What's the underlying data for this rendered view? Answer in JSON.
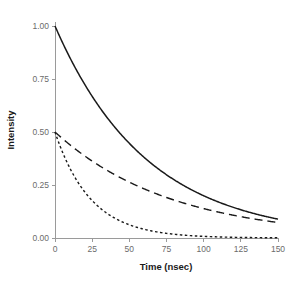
{
  "chart_data": {
    "type": "line",
    "title": "",
    "xlabel": "Time (nsec)",
    "ylabel": "Intensity",
    "xlim": [
      0,
      150
    ],
    "ylim": [
      0,
      1.0
    ],
    "xticks": [
      0,
      25,
      50,
      75,
      100,
      125,
      150
    ],
    "xtick_labels": [
      "0",
      "25",
      "50",
      "75",
      "100",
      "125",
      "150"
    ],
    "yticks": [
      0.0,
      0.25,
      0.5,
      0.75,
      1.0
    ],
    "ytick_labels": [
      "0.00",
      "0.25",
      "0.50",
      "0.75",
      "1.00"
    ],
    "grid": false,
    "legend": "none",
    "line_color": "#1a1a1a",
    "axis_color": "#9a9a9a",
    "background": "#ffffff",
    "x": [
      0,
      5,
      10,
      15,
      20,
      25,
      30,
      35,
      40,
      45,
      50,
      55,
      60,
      65,
      70,
      75,
      80,
      85,
      90,
      95,
      100,
      105,
      110,
      115,
      120,
      125,
      130,
      135,
      140,
      145,
      150
    ],
    "series": [
      {
        "name": "solid-curve",
        "style": "solid",
        "amplitude": 1.0,
        "lifetime_nsec": 62,
        "values": [
          1.0,
          0.923,
          0.852,
          0.786,
          0.725,
          0.669,
          0.618,
          0.57,
          0.526,
          0.485,
          0.448,
          0.413,
          0.381,
          0.352,
          0.325,
          0.3,
          0.276,
          0.255,
          0.235,
          0.217,
          0.2,
          0.185,
          0.171,
          0.157,
          0.145,
          0.134,
          0.124,
          0.114,
          0.105,
          0.097,
          0.09
        ]
      },
      {
        "name": "long-dashed-curve",
        "style": "dashed",
        "amplitude": 0.5,
        "lifetime_nsec": 78,
        "values": [
          0.5,
          0.469,
          0.44,
          0.413,
          0.387,
          0.363,
          0.341,
          0.32,
          0.3,
          0.281,
          0.264,
          0.247,
          0.232,
          0.218,
          0.204,
          0.192,
          0.18,
          0.169,
          0.158,
          0.148,
          0.139,
          0.131,
          0.123,
          0.115,
          0.108,
          0.101,
          0.095,
          0.089,
          0.084,
          0.078,
          0.074
        ]
      },
      {
        "name": "short-dashed-curve",
        "style": "dotted",
        "amplitude": 0.5,
        "lifetime_nsec": 24,
        "values": [
          0.5,
          0.406,
          0.33,
          0.268,
          0.218,
          0.177,
          0.144,
          0.117,
          0.095,
          0.077,
          0.063,
          0.051,
          0.041,
          0.033,
          0.027,
          0.022,
          0.018,
          0.015,
          0.012,
          0.01,
          0.008,
          0.006,
          0.005,
          0.004,
          0.003,
          0.003,
          0.002,
          0.002,
          0.001,
          0.001,
          0.001
        ]
      }
    ]
  }
}
